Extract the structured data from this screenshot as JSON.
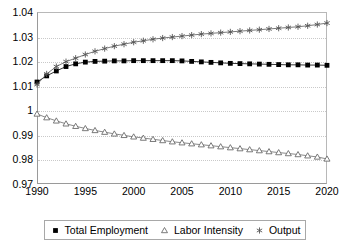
{
  "chart_data": {
    "type": "line",
    "title": "",
    "xlabel": "",
    "ylabel": "",
    "xlim": [
      1990,
      2020
    ],
    "ylim": [
      0.97,
      1.04
    ],
    "grid": true,
    "legend_position": "bottom",
    "x": [
      1990,
      1991,
      1992,
      1993,
      1994,
      1995,
      1996,
      1997,
      1998,
      1999,
      2000,
      2001,
      2002,
      2003,
      2004,
      2005,
      2006,
      2007,
      2008,
      2009,
      2010,
      2011,
      2012,
      2013,
      2014,
      2015,
      2016,
      2017,
      2018,
      2019,
      2020
    ],
    "xticks": [
      "1990",
      "1995",
      "2000",
      "2005",
      "2010",
      "2015",
      "2020"
    ],
    "yticks": [
      "0.97",
      "0.98",
      "0.99",
      "1",
      "1.01",
      "1.02",
      "1.03",
      "1.04"
    ],
    "series": [
      {
        "name": "Total Employment",
        "marker": "filled-square",
        "color": "#000000",
        "values": [
          1.0115,
          1.014,
          1.016,
          1.0178,
          1.0189,
          1.0196,
          1.0199,
          1.02,
          1.0201,
          1.0201,
          1.0202,
          1.0202,
          1.0202,
          1.0202,
          1.0202,
          1.0201,
          1.0199,
          1.0197,
          1.0195,
          1.0193,
          1.0191,
          1.019,
          1.0189,
          1.0188,
          1.0187,
          1.0186,
          1.0185,
          1.0185,
          1.0184,
          1.0184,
          1.0183
        ]
      },
      {
        "name": "Labor Intensity",
        "marker": "open-triangle",
        "color": "#6b6b6b",
        "values": [
          0.9985,
          0.997,
          0.9957,
          0.9945,
          0.9935,
          0.9926,
          0.9918,
          0.9911,
          0.9904,
          0.9898,
          0.9892,
          0.9887,
          0.9882,
          0.9877,
          0.9872,
          0.9868,
          0.9864,
          0.986,
          0.9856,
          0.9852,
          0.9848,
          0.9844,
          0.984,
          0.9836,
          0.9832,
          0.9828,
          0.9824,
          0.982,
          0.9815,
          0.981,
          0.9802
        ]
      },
      {
        "name": "Output",
        "marker": "asterisk",
        "color": "#555555",
        "values": [
          1.0105,
          1.0148,
          1.0178,
          1.0198,
          1.0212,
          1.0227,
          1.024,
          1.0251,
          1.0261,
          1.0269,
          1.0277,
          1.0283,
          1.0289,
          1.0294,
          1.0298,
          1.0302,
          1.0306,
          1.031,
          1.0313,
          1.0316,
          1.0319,
          1.0322,
          1.0325,
          1.0328,
          1.0331,
          1.0334,
          1.0337,
          1.034,
          1.0344,
          1.0349,
          1.0355
        ]
      }
    ]
  },
  "legend": {
    "items": [
      {
        "label": "Total Employment"
      },
      {
        "label": "Labor Intensity"
      },
      {
        "label": "Output"
      }
    ]
  }
}
